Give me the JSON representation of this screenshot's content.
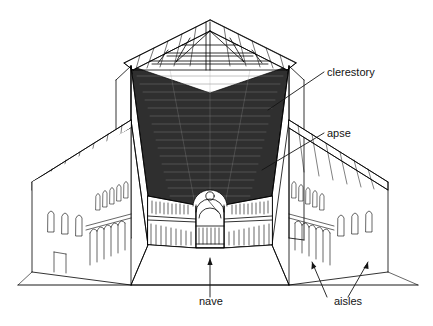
{
  "figure": {
    "style": "black and white line drawing",
    "background_color": "#ffffff",
    "line_color": "#000000",
    "ceiling_fill": "#2b2b2b"
  },
  "labels": [
    {
      "id": "clerestory",
      "text": "clerestory",
      "x": 327,
      "y": 76,
      "leader": "down-left to upper nave wall window band"
    },
    {
      "id": "apse",
      "text": "apse",
      "x": 327,
      "y": 137,
      "leader": "down-left to semicircular apse vault"
    },
    {
      "id": "nave",
      "text": "nave",
      "x": 199,
      "y": 305,
      "leader": "vertical arrow up to central nave floor"
    },
    {
      "id": "aisles",
      "text": "aisles",
      "x": 334,
      "y": 305,
      "leader": "two arrows up-left and up-right to side aisles"
    }
  ],
  "parts": {
    "roof": "open timber truss gable roof",
    "ceiling": "dark coffered wooden nave ceiling",
    "colonnade": "receding arcade of columns on both sides of nave",
    "apse_feature": "semicircular arched apse with oculus",
    "aisle_roof": "low sloping shed roofs over side aisles",
    "windows": "round-arched windows in clerestory and aisle walls"
  }
}
